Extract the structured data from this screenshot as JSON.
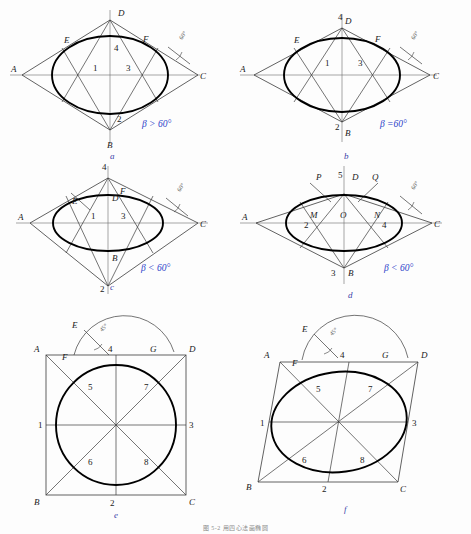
{
  "page": {
    "footer_note": "图 5-2   用四心法画椭圆"
  },
  "figures": [
    {
      "id": "a",
      "caption": "a",
      "condition": "β > 60°",
      "angle_label": "60°",
      "vertices": [
        "A",
        "B",
        "C",
        "D"
      ],
      "centers": [
        "1",
        "2",
        "3",
        "4"
      ],
      "aux_points": [
        "E",
        "F"
      ]
    },
    {
      "id": "b",
      "caption": "b",
      "condition": "β =60°",
      "angle_label": "60°",
      "vertices": [
        "A",
        "B",
        "C",
        "D"
      ],
      "centers": [
        "1",
        "2",
        "3",
        "4"
      ],
      "aux_points": [
        "E",
        "F"
      ]
    },
    {
      "id": "c",
      "caption": "c",
      "condition": "β < 60°",
      "angle_label": "60°",
      "vertices": [
        "A",
        "B",
        "C",
        "D"
      ],
      "centers": [
        "1",
        "2",
        "3",
        "4"
      ],
      "aux_points": [
        "E",
        "F"
      ]
    },
    {
      "id": "d",
      "caption": "d",
      "condition": "β < 60°",
      "angle_label": "60°",
      "vertices": [
        "A",
        "B",
        "C",
        "D"
      ],
      "centers": [
        "1",
        "2",
        "3",
        "4",
        "5"
      ],
      "aux_points": [
        "M",
        "N",
        "O",
        "P",
        "Q"
      ]
    },
    {
      "id": "e",
      "caption": "e",
      "angle_label": "45°",
      "vertices": [
        "A",
        "B",
        "C",
        "D"
      ],
      "centers": [
        "1",
        "2",
        "3",
        "4",
        "5",
        "6",
        "7",
        "8"
      ],
      "aux_points": [
        "E",
        "F",
        "G"
      ]
    },
    {
      "id": "f",
      "caption": "f",
      "angle_label": "45°",
      "vertices": [
        "A",
        "B",
        "C",
        "D"
      ],
      "centers": [
        "1",
        "2",
        "3",
        "4",
        "5",
        "6",
        "7",
        "8"
      ],
      "aux_points": [
        "E",
        "F",
        "G"
      ]
    }
  ]
}
